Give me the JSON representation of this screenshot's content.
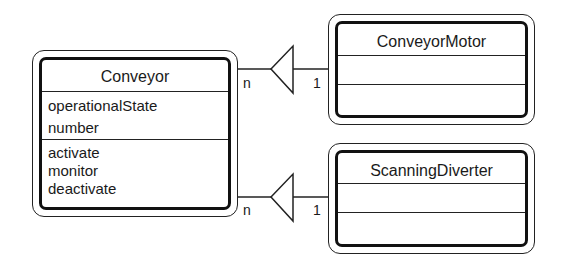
{
  "diagram": {
    "type": "UML class diagram",
    "classes": [
      {
        "name": "Conveyor",
        "attributes": [
          "operationalState",
          "number"
        ],
        "operations": [
          "activate",
          "monitor",
          "deactivate"
        ]
      },
      {
        "name": "ConveyorMotor",
        "attributes": [],
        "operations": []
      },
      {
        "name": "ScanningDiverter",
        "attributes": [],
        "operations": []
      }
    ],
    "relationships": [
      {
        "from": "Conveyor",
        "to": "ConveyorMotor",
        "kind": "aggregation-triangle",
        "from_multiplicity": "n",
        "to_multiplicity": "1"
      },
      {
        "from": "Conveyor",
        "to": "ScanningDiverter",
        "kind": "aggregation-triangle",
        "from_multiplicity": "n",
        "to_multiplicity": "1"
      }
    ]
  },
  "colors": {
    "line": "#222222",
    "background": "#ffffff"
  }
}
